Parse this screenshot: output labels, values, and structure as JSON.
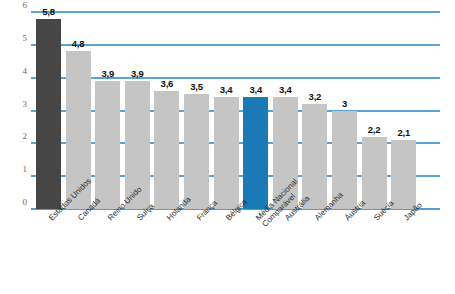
{
  "chart_data": {
    "type": "bar",
    "title": "",
    "xlabel": "",
    "ylabel": "",
    "ylim": [
      0,
      6
    ],
    "yticks": [
      "0",
      "1",
      "2",
      "3",
      "4",
      "5",
      "6"
    ],
    "grid": true,
    "legend": "none",
    "decimal_separator": ",",
    "categories": [
      "Estados Unidos",
      "Canadá",
      "Reino Unido",
      "Suíça",
      "Holanda",
      "França",
      "Bélgica",
      "Média Nacional Comparável",
      "Austrália",
      "Alemanha",
      "Áustria",
      "Suécia",
      "Japão"
    ],
    "values": [
      5.8,
      4.8,
      3.9,
      3.9,
      3.6,
      3.5,
      3.4,
      3.4,
      3.4,
      3.2,
      3.0,
      2.2,
      2.1
    ],
    "value_labels": [
      "5,8",
      "4,8",
      "3,9",
      "3,9",
      "3,6",
      "3,5",
      "3,4",
      "3,4",
      "3,4",
      "3,2",
      "3",
      "2,2",
      "2,1"
    ],
    "bar_styles": [
      "dark",
      "light",
      "light",
      "light",
      "light",
      "light",
      "light",
      "blue",
      "light",
      "light",
      "light",
      "light",
      "light"
    ],
    "category_lines": [
      [
        "Estados Unidos"
      ],
      [
        "Canadá"
      ],
      [
        "Reino Unido"
      ],
      [
        "Suíça"
      ],
      [
        "Holanda"
      ],
      [
        "França"
      ],
      [
        "Bélgica"
      ],
      [
        "Média Nacional",
        "Comparável"
      ],
      [
        "Austrália"
      ],
      [
        "Alemanha"
      ],
      [
        "Áustria"
      ],
      [
        "Suécia"
      ],
      [
        "Japão"
      ]
    ],
    "colors": {
      "highlight_dark": "#464646",
      "bar_light": "#c5c5c5",
      "highlight_blue": "#1a7ab5",
      "gridline": "#5ba3d6",
      "axis_text": "#6a6a6a",
      "label_text": "#111111"
    }
  }
}
